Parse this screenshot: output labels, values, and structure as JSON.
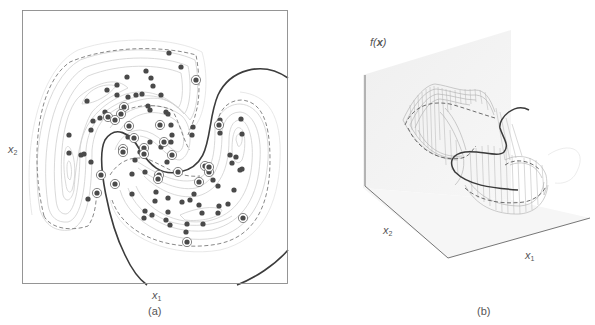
{
  "figure": {
    "panels": [
      {
        "id": "a",
        "caption": "(a)",
        "xlabel": "x",
        "xlabel_sub": "1",
        "ylabel": "x",
        "ylabel_sub": "2"
      },
      {
        "id": "b",
        "caption": "(b)",
        "zlabel": "f(",
        "zlabel_bold": "x",
        "zlabel_close": ")",
        "xlabel": "x",
        "xlabel_sub": "1",
        "ylabel": "x",
        "ylabel_sub": "2"
      }
    ]
  },
  "colors": {
    "frame": "#8a8a8a",
    "point": "#4a4a4a",
    "contour": "#c8c8c8",
    "margin_dashed": "#777777",
    "boundary": "#3a3a3a",
    "plane": "#ececec",
    "wire": "#9a9a9a"
  },
  "chart_data": [
    {
      "type": "scatter",
      "title": "(a)",
      "xlabel": "x1",
      "ylabel": "x2",
      "grid": false,
      "legend": null,
      "annotations": [
        "contours of f(x)",
        "dashed margin contours f(x)=±1",
        "solid decision boundary f(x)=0",
        "circled points = support vectors"
      ],
      "x_range_px": [
        22,
        288
      ],
      "y_range_px": [
        10,
        284
      ],
      "series": [
        {
          "name": "data points",
          "points": [
            [
              169,
              53
            ],
            [
              181,
              67
            ],
            [
              146,
              71
            ],
            [
              151,
              78
            ],
            [
              153,
              86
            ],
            [
              127,
              77
            ],
            [
              117,
              85
            ],
            [
              107,
              90
            ],
            [
              87,
              101
            ],
            [
              117,
              95
            ],
            [
              128,
              97
            ],
            [
              136,
              95
            ],
            [
              142,
              94
            ],
            [
              161,
              95
            ],
            [
              148,
              106
            ],
            [
              150,
              110
            ],
            [
              166,
              112
            ],
            [
              168,
              114
            ],
            [
              93,
              121
            ],
            [
              91,
              130
            ],
            [
              69,
              135
            ],
            [
              69,
              153
            ],
            [
              81,
              155
            ],
            [
              84,
              154
            ],
            [
              91,
              162
            ],
            [
              88,
              199
            ],
            [
              171,
              125
            ],
            [
              172,
              135
            ],
            [
              193,
              127
            ],
            [
              192,
              135
            ],
            [
              220,
              120
            ],
            [
              241,
              119
            ],
            [
              242,
              134
            ],
            [
              220,
              133
            ],
            [
              230,
              155
            ],
            [
              236,
              157
            ],
            [
              232,
              163
            ],
            [
              242,
              169
            ],
            [
              240,
              170
            ],
            [
              234,
              190
            ],
            [
              228,
              204
            ],
            [
              219,
              206
            ],
            [
              218,
              186
            ],
            [
              213,
              180
            ],
            [
              218,
              213
            ],
            [
              202,
              213
            ],
            [
              194,
              194
            ],
            [
              190,
              200
            ],
            [
              199,
              205
            ],
            [
              182,
              202
            ],
            [
              168,
              198
            ],
            [
              168,
              212
            ],
            [
              166,
              220
            ],
            [
              156,
              192
            ],
            [
              155,
              201
            ],
            [
              145,
              211
            ],
            [
              132,
              194
            ],
            [
              132,
              174
            ],
            [
              145,
              172
            ],
            [
              135,
              160
            ],
            [
              140,
              152
            ],
            [
              150,
              142
            ],
            [
              167,
              162
            ],
            [
              171,
              142
            ],
            [
              152,
              215
            ],
            [
              144,
              218
            ],
            [
              170,
              225
            ],
            [
              203,
              224
            ],
            [
              187,
              224
            ],
            [
              186,
              232
            ],
            [
              105,
              112
            ],
            [
              128,
              137
            ],
            [
              100,
              118
            ],
            [
              161,
              147
            ]
          ]
        },
        {
          "name": "support vectors",
          "points": [
            [
              196,
              80
            ],
            [
              124,
              107
            ],
            [
              121,
              114
            ],
            [
              108,
              117
            ],
            [
              115,
              120
            ],
            [
              129,
              126
            ],
            [
              134,
              138
            ],
            [
              123,
              149
            ],
            [
              123,
              152
            ],
            [
              144,
              148
            ],
            [
              144,
              154
            ],
            [
              160,
              125
            ],
            [
              164,
              142
            ],
            [
              172,
              155
            ],
            [
              159,
              175
            ],
            [
              158,
              179
            ],
            [
              178,
              172
            ],
            [
              199,
              182
            ],
            [
              205,
              166
            ],
            [
              209,
              172
            ],
            [
              209,
              167
            ],
            [
              219,
              125
            ],
            [
              97,
              193
            ],
            [
              101,
              175
            ],
            [
              115,
              184
            ],
            [
              187,
              242
            ],
            [
              243,
              218
            ]
          ]
        }
      ]
    },
    {
      "type": "surface",
      "title": "(b)",
      "xlabel": "x1",
      "ylabel": "x2",
      "zlabel": "f(x)",
      "annotations": [
        "wireframe surface of f(x)",
        "dashed margin contours",
        "solid decision boundary f(x)=0"
      ]
    }
  ]
}
